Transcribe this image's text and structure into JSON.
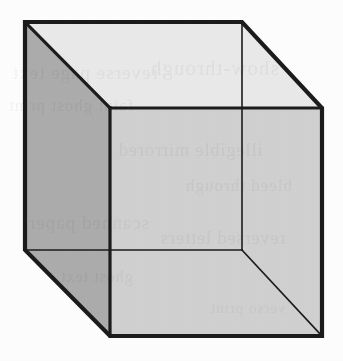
{
  "figure": {
    "canvas": {
      "width": 343,
      "height": 361,
      "background": "#fdfdfd"
    },
    "colors": {
      "stroke": "#1c1c1c",
      "top_face": "#e9e9e9",
      "left_face": "#abacab",
      "front_face": "#d0d0d0",
      "right_face": "#d0d0d0",
      "background": "#fdfdfd"
    },
    "stroke_widths": {
      "silhouette": 4.2,
      "hidden_edge": 1.6,
      "visible_inner_edge": 3.2
    },
    "vertices": {
      "back_top_left": [
        25,
        22
      ],
      "back_top_right": [
        242,
        22
      ],
      "back_bottom_right": [
        242,
        250
      ],
      "back_bottom_left": [
        25,
        250
      ],
      "front_top_left": [
        110,
        108
      ],
      "front_top_right": [
        322,
        108
      ],
      "front_bottom_right": [
        322,
        336
      ],
      "front_bottom_left": [
        110,
        336
      ]
    },
    "faces": [
      {
        "name": "top-face",
        "fill": "#e9e9e9",
        "points": "25,22 242,22 322,108 110,108"
      },
      {
        "name": "left-face",
        "fill": "#abacab",
        "points": "25,22 110,108 110,336 25,250"
      },
      {
        "name": "front-face",
        "fill": "#d0d0d0",
        "points": "110,108 322,108 322,336 110,336"
      }
    ],
    "edges": [
      {
        "name": "silhouette-outline",
        "type": "silhouette",
        "points": "25,22 242,22 322,108 322,336 110,336 25,250 25,22"
      },
      {
        "name": "front-top-edge",
        "type": "visible-inner",
        "points": "110,108 322,108"
      },
      {
        "name": "front-left-edge",
        "type": "visible-inner",
        "points": "110,108 110,336"
      },
      {
        "name": "top-left-diagonal",
        "type": "visible-inner",
        "points": "25,22 110,108"
      },
      {
        "name": "hidden-back-vertical-edge",
        "type": "hidden",
        "points": "242,22 242,250"
      },
      {
        "name": "hidden-back-bottom-edge",
        "type": "hidden",
        "points": "25,250 242,250"
      },
      {
        "name": "hidden-back-bottom-right-diagonal",
        "type": "hidden",
        "points": "242,250 322,336"
      }
    ]
  },
  "showthrough": {
    "note": "illegible reverse-side print bleeding through the scanned page",
    "lines": [
      {
        "text": "reverse page text",
        "x": 12,
        "y": 62,
        "size": 19
      },
      {
        "text": "show-through",
        "x": 150,
        "y": 56,
        "size": 21
      },
      {
        "text": "faint ghost print",
        "x": 8,
        "y": 96,
        "size": 17
      },
      {
        "text": "illegible mirrored",
        "x": 118,
        "y": 140,
        "size": 18
      },
      {
        "text": "bleed through",
        "x": 185,
        "y": 176,
        "size": 17
      },
      {
        "text": "scanned paper",
        "x": 28,
        "y": 212,
        "size": 19
      },
      {
        "text": "reversed letters",
        "x": 160,
        "y": 228,
        "size": 18
      },
      {
        "text": "ghost text",
        "x": 60,
        "y": 268,
        "size": 16
      },
      {
        "text": "verso print",
        "x": 210,
        "y": 300,
        "size": 15
      }
    ]
  }
}
